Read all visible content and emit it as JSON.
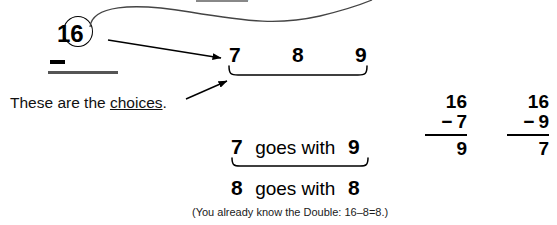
{
  "worksheet": {
    "minuend": {
      "tens_digit": "1",
      "circled_ones_digit": "6",
      "operator": "−"
    },
    "choices": {
      "label": "choices-row",
      "values": [
        "7",
        "8",
        "9"
      ]
    },
    "callout": {
      "text_before": "These are the ",
      "emphasis": "choices",
      "text_after": "."
    },
    "pairs": [
      {
        "left": "7",
        "connector": "goes with",
        "right": "9"
      },
      {
        "left": "8",
        "connector": "goes with",
        "right": "8"
      }
    ],
    "footnote": "(You already know the Double: 16–8=8.)",
    "problems": [
      {
        "minuend": "16",
        "operator": "−",
        "subtrahend": "7",
        "difference": "9"
      },
      {
        "minuend": "16",
        "operator": "−",
        "subtrahend": "9",
        "difference": "7"
      }
    ],
    "colors": {
      "ink": "#000000",
      "rule": "#555555",
      "background": "#ffffff"
    }
  }
}
